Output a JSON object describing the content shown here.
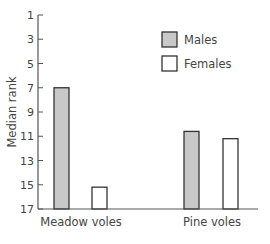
{
  "chart_data": {
    "type": "bar",
    "title": "",
    "xlabel": "",
    "ylabel": "Median rank",
    "ylim": [
      17,
      1
    ],
    "y_inverted": true,
    "yticks": [
      1,
      3,
      5,
      7,
      9,
      11,
      13,
      15,
      17
    ],
    "categories": [
      "Meadow voles",
      "Pine voles"
    ],
    "series": [
      {
        "name": "Males",
        "color": "#c8c8c8",
        "values": [
          7.0,
          10.6
        ]
      },
      {
        "name": "Females",
        "color": "#ffffff",
        "values": [
          15.2,
          11.2
        ]
      }
    ],
    "grid": false,
    "legend_position": "top-right"
  },
  "colors": {
    "axis": "#555555",
    "bar_stroke": "#333333",
    "males_fill": "#c8c8c8",
    "females_fill": "#ffffff"
  }
}
